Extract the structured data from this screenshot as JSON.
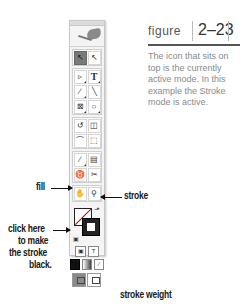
{
  "figure": {
    "word": "figure",
    "number": "2–23",
    "caption": "The icon that sits on top is the currently active mode. In this example the Stroke mode is active."
  },
  "toolbox": {
    "tools": [
      [
        {
          "name": "selection-tool",
          "glyph": "↖",
          "active": true
        },
        {
          "name": "direct-selection-tool",
          "glyph": "↖",
          "active": false
        }
      ],
      [
        {
          "name": "pen-tool",
          "glyph": "▹",
          "active": false
        },
        {
          "name": "type-tool",
          "glyph": "T",
          "active": false
        }
      ],
      [
        {
          "name": "pencil-tool",
          "glyph": "∕",
          "active": false
        },
        {
          "name": "line-tool",
          "glyph": "╲",
          "active": false
        }
      ],
      [
        {
          "name": "rectangle-frame-tool",
          "glyph": "⊠",
          "active": false
        },
        {
          "name": "ellipse-tool",
          "glyph": "○",
          "active": false
        }
      ],
      [
        {
          "name": "rotate-tool",
          "glyph": "↺",
          "active": false
        },
        {
          "name": "scale-tool",
          "glyph": "◫",
          "active": false
        }
      ],
      [
        {
          "name": "shear-tool",
          "glyph": "⌒",
          "active": false
        },
        {
          "name": "free-transform-tool",
          "glyph": "⬚",
          "active": false
        }
      ],
      [
        {
          "name": "eyedropper-tool",
          "glyph": "∕",
          "active": false
        },
        {
          "name": "gradient-tool",
          "glyph": "▤",
          "active": false
        }
      ],
      [
        {
          "name": "button-tool",
          "glyph": "♉",
          "active": false
        },
        {
          "name": "scissors-tool",
          "glyph": "✂",
          "active": false
        }
      ],
      [
        {
          "name": "hand-tool",
          "glyph": "✋",
          "active": false
        },
        {
          "name": "zoom-tool",
          "glyph": "⚲",
          "active": false
        }
      ]
    ],
    "swap_glyph": "⬏",
    "default_glyph": "▣",
    "format_container_glyph": "▣",
    "format_text_glyph": "T",
    "apply_none_glyph": "∕"
  },
  "annotations": {
    "fill": "fill",
    "stroke": "stroke",
    "click_here": "click here",
    "click_line2": "to make",
    "click_line3": "the stroke",
    "click_line4": "black.",
    "stroke_weight": "stroke weight"
  }
}
